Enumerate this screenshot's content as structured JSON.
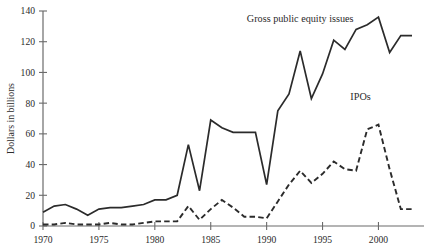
{
  "chart_data": {
    "type": "line",
    "title": "",
    "subtitle": "",
    "xlabel": "",
    "ylabel": "Dollars in billions",
    "xlim": [
      1970,
      2003
    ],
    "ylim": [
      0,
      140
    ],
    "grid": false,
    "legend_position": "inline-annotations",
    "x_ticks": [
      "1970",
      "1975",
      "1980",
      "1985",
      "1990",
      "1995",
      "2000"
    ],
    "x_tick_values": [
      1970,
      1975,
      1980,
      1985,
      1990,
      1995,
      2000
    ],
    "y_ticks": [
      "0",
      "20",
      "40",
      "60",
      "80",
      "100",
      "120",
      "140"
    ],
    "y_tick_values": [
      0,
      20,
      40,
      60,
      80,
      100,
      120,
      140
    ],
    "x": [
      1970,
      1971,
      1972,
      1973,
      1974,
      1975,
      1976,
      1977,
      1978,
      1979,
      1980,
      1981,
      1982,
      1983,
      1984,
      1985,
      1986,
      1987,
      1988,
      1989,
      1990,
      1991,
      1992,
      1993,
      1994,
      1995,
      1996,
      1997,
      1998,
      1999,
      2000,
      2001,
      2002,
      2003
    ],
    "series": [
      {
        "name": "Gross public equity issues",
        "style": "solid",
        "color": "#2b2b2b",
        "annotation": "Gross public equity issues",
        "values": [
          9,
          13,
          14,
          11,
          7,
          11,
          12,
          12,
          13,
          14,
          17,
          17,
          20,
          53,
          23,
          69,
          64,
          61,
          61,
          61,
          27,
          75,
          86,
          114,
          83,
          99,
          121,
          115,
          128,
          131,
          136,
          113,
          124,
          124
        ]
      },
      {
        "name": "IPOs",
        "style": "dashed",
        "color": "#2b2b2b",
        "annotation": "IPOs",
        "values": [
          1,
          1,
          2,
          1,
          1,
          1,
          2,
          1,
          1,
          2,
          3,
          3,
          3,
          13,
          4,
          11,
          17,
          12,
          6,
          6,
          5,
          16,
          27,
          36,
          28,
          34,
          42,
          37,
          36,
          63,
          66,
          37,
          11,
          11
        ]
      }
    ],
    "annotations": [
      {
        "text": "Gross public equity issues",
        "x": 1993,
        "y": 133,
        "anchor": "middle"
      },
      {
        "text": "IPOs",
        "x": 1998.4,
        "y": 82,
        "anchor": "middle"
      }
    ]
  }
}
